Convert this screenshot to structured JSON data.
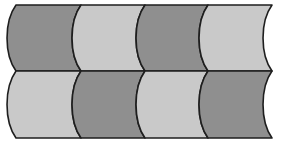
{
  "diagram": {
    "colors": {
      "dark": "#8f8f8f",
      "light": "#c9c9c9",
      "stroke": "#1e1e1e",
      "background": "#ffffff"
    },
    "rows": [
      {
        "y_top": 5,
        "y_bottom": 71,
        "segments": [
          "dark",
          "light",
          "dark",
          "light"
        ]
      },
      {
        "y_top": 71,
        "y_bottom": 138,
        "segments": [
          "light",
          "dark",
          "light",
          "dark"
        ]
      }
    ],
    "boundaries_x": [
      16,
      81,
      145,
      208,
      272
    ],
    "bulge": 9
  }
}
